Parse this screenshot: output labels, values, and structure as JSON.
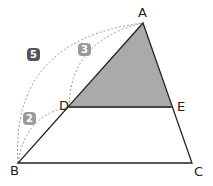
{
  "diagram": {
    "type": "geometry-similar-triangles",
    "points": {
      "A": {
        "label": "A",
        "x": 143,
        "y": 23
      },
      "B": {
        "label": "B",
        "x": 18,
        "y": 163
      },
      "C": {
        "label": "C",
        "x": 192,
        "y": 163
      },
      "D": {
        "label": "D",
        "x": 69,
        "y": 107
      },
      "E": {
        "label": "E",
        "x": 172,
        "y": 107
      }
    },
    "shaded_region": [
      "A",
      "D",
      "E"
    ],
    "arcs": [
      {
        "from": "B",
        "to": "A",
        "value": "5",
        "color": "#555555"
      },
      {
        "from": "D",
        "to": "A",
        "value": "3",
        "color": "#9a9a9a"
      },
      {
        "from": "B",
        "to": "D",
        "value": "2",
        "color": "#9a9a9a"
      }
    ],
    "colors": {
      "line": "#222222",
      "shade": "#aaaaaa",
      "dash": "#999999"
    }
  }
}
